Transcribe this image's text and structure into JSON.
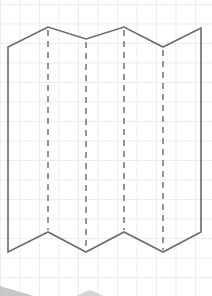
{
  "diagram": {
    "grid": {
      "spacing_px": 19.5,
      "color": "#ececec"
    },
    "stroke_color": "#6b6b6b",
    "fold_line_color": "#7a7a7a",
    "outline": {
      "top": [
        [
          8,
          47
        ],
        [
          48,
          27
        ],
        [
          86,
          39
        ],
        [
          124,
          27
        ],
        [
          163,
          47
        ],
        [
          201,
          28
        ]
      ],
      "bottom": [
        [
          8,
          252
        ],
        [
          48,
          232
        ],
        [
          86,
          252
        ],
        [
          124,
          232
        ],
        [
          163,
          252
        ],
        [
          201,
          232
        ]
      ]
    },
    "fold_lines_x": [
      48,
      86,
      124,
      163
    ],
    "panels": 5,
    "shadow_color": "#b5b5b5"
  }
}
